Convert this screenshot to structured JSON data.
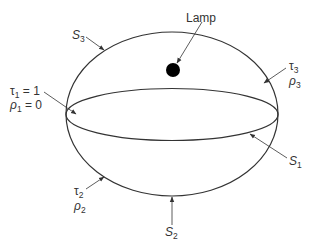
{
  "diagram": {
    "title": "",
    "colors": {
      "stroke": "#333333",
      "lamp": "#000000",
      "background": "#ffffff"
    },
    "shapes": {
      "outer_sphere": {
        "cx": 172,
        "cy": 114,
        "rx": 106,
        "ry": 82
      },
      "equator": {
        "cx": 172,
        "cy": 114.5,
        "rx": 106,
        "ry": 26
      },
      "lamp": {
        "cx": 173,
        "cy": 70,
        "r": 7
      }
    },
    "labels": {
      "lamp": "Lamp",
      "s3": {
        "main": "S",
        "sub": "3"
      },
      "s1": {
        "main": "S",
        "sub": "1"
      },
      "s2": {
        "main": "S",
        "sub": "2"
      },
      "tau1": {
        "main": "τ",
        "sub": "1",
        "rest": " = 1"
      },
      "rho1": {
        "main": "ρ",
        "sub": "1",
        "rest": " = 0"
      },
      "tau3": {
        "main": "τ",
        "sub": "3"
      },
      "rho3": {
        "main": "ρ",
        "sub": "3"
      },
      "tau2": {
        "main": "τ",
        "sub": "2"
      },
      "rho2": {
        "main": "ρ",
        "sub": "2"
      }
    }
  }
}
